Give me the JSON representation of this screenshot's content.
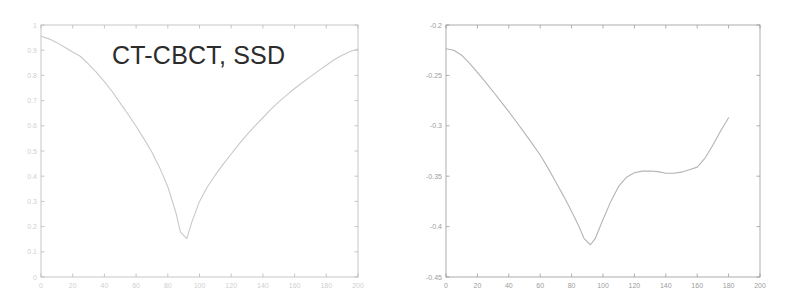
{
  "figure": {
    "background_color": "#ffffff",
    "panel_count": 2
  },
  "panels": [
    {
      "name": "ssd-panel",
      "title": "CT-CBCT, SSD",
      "axis_color": "#b9b9b9",
      "curve_color": "#c9c9c9",
      "tick_label_color": "#cfcfcf"
    },
    {
      "name": "cc-panel",
      "title": "CT-CBCT, CC",
      "axis_color": "#9a9a9a",
      "curve_color": "#b4b4b4",
      "tick_label_color": "#9d9d9d"
    }
  ],
  "chart_data": [
    {
      "type": "line",
      "name": "ssd-curve",
      "title": "CT-CBCT, SSD",
      "xlabel": "",
      "ylabel": "",
      "xlim": [
        0,
        200
      ],
      "ylim": [
        0,
        1
      ],
      "grid": false,
      "legend": null,
      "xticks": [
        0,
        20,
        40,
        60,
        80,
        100,
        120,
        140,
        160,
        180,
        200
      ],
      "xticklabels": [
        "0",
        "20",
        "40",
        "60",
        "80",
        "100",
        "120",
        "140",
        "160",
        "180",
        "200"
      ],
      "yticks": [
        0,
        0.1,
        0.2,
        0.3,
        0.4,
        0.5,
        0.6,
        0.7,
        0.8,
        0.9,
        1
      ],
      "yticklabels": [
        "0",
        "0.1",
        "0.2",
        "0.3",
        "0.4",
        "0.5",
        "0.6",
        "0.7",
        "0.8",
        "0.9",
        "1"
      ],
      "x": [
        0,
        5,
        10,
        15,
        20,
        25,
        30,
        35,
        40,
        45,
        50,
        55,
        60,
        65,
        70,
        75,
        80,
        85,
        88,
        92,
        95,
        100,
        105,
        110,
        115,
        120,
        125,
        130,
        135,
        140,
        145,
        150,
        155,
        160,
        165,
        170,
        175,
        180,
        185,
        190,
        195,
        200
      ],
      "y": [
        0.955,
        0.945,
        0.93,
        0.912,
        0.893,
        0.875,
        0.845,
        0.812,
        0.775,
        0.735,
        0.69,
        0.645,
        0.598,
        0.548,
        0.495,
        0.432,
        0.358,
        0.258,
        0.178,
        0.152,
        0.215,
        0.3,
        0.358,
        0.405,
        0.448,
        0.488,
        0.528,
        0.565,
        0.6,
        0.632,
        0.665,
        0.695,
        0.722,
        0.748,
        0.772,
        0.795,
        0.818,
        0.84,
        0.862,
        0.88,
        0.895,
        0.905
      ]
    },
    {
      "type": "line",
      "name": "cc-curve",
      "title": "CT-CBCT, CC",
      "xlabel": "",
      "ylabel": "",
      "xlim": [
        0,
        200
      ],
      "ylim": [
        -0.45,
        -0.2
      ],
      "grid": false,
      "legend": null,
      "xticks": [
        0,
        20,
        40,
        60,
        80,
        100,
        120,
        140,
        160,
        180,
        200
      ],
      "xticklabels": [
        "0",
        "20",
        "40",
        "60",
        "80",
        "100",
        "120",
        "140",
        "160",
        "180",
        "200"
      ],
      "yticks": [
        -0.45,
        -0.4,
        -0.35,
        -0.3,
        -0.25,
        -0.2
      ],
      "yticklabels": [
        "-0.45",
        "-0.4",
        "-0.35",
        "-0.3",
        "-0.25",
        "-0.2"
      ],
      "x": [
        0,
        5,
        10,
        15,
        20,
        25,
        30,
        35,
        40,
        45,
        50,
        55,
        60,
        65,
        70,
        75,
        80,
        85,
        88,
        92,
        95,
        100,
        105,
        110,
        115,
        120,
        125,
        130,
        135,
        140,
        145,
        150,
        155,
        160,
        165,
        170,
        175,
        180
      ],
      "y": [
        -0.2235,
        -0.225,
        -0.23,
        -0.238,
        -0.247,
        -0.2565,
        -0.266,
        -0.276,
        -0.286,
        -0.2965,
        -0.307,
        -0.318,
        -0.329,
        -0.342,
        -0.356,
        -0.37,
        -0.385,
        -0.401,
        -0.412,
        -0.418,
        -0.412,
        -0.393,
        -0.375,
        -0.36,
        -0.351,
        -0.3465,
        -0.345,
        -0.3448,
        -0.3455,
        -0.347,
        -0.347,
        -0.346,
        -0.3435,
        -0.341,
        -0.332,
        -0.319,
        -0.305,
        -0.292
      ]
    }
  ]
}
